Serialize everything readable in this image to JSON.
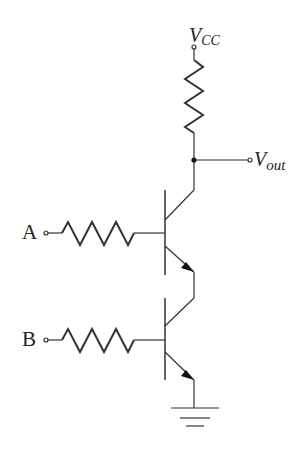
{
  "diagram": {
    "type": "circuit",
    "title": "",
    "labels": {
      "vcc_main": "V",
      "vcc_sub": "CC",
      "vout_main": "V",
      "vout_sub": "out",
      "input_a": "A",
      "input_b": "B"
    },
    "components": [
      {
        "id": "R_collector",
        "type": "resistor",
        "from": "VCC",
        "to": "Vout"
      },
      {
        "id": "R_a",
        "type": "resistor",
        "from": "A",
        "to": "Q1.base"
      },
      {
        "id": "R_b",
        "type": "resistor",
        "from": "B",
        "to": "Q2.base"
      },
      {
        "id": "Q1",
        "type": "npn-transistor",
        "collector": "Vout",
        "emitter": "Q2.collector"
      },
      {
        "id": "Q2",
        "type": "npn-transistor",
        "collector": "Q1.emitter",
        "emitter": "GND"
      },
      {
        "id": "GND",
        "type": "ground"
      }
    ],
    "colors": {
      "line": "#333333",
      "background": "#ffffff"
    }
  }
}
